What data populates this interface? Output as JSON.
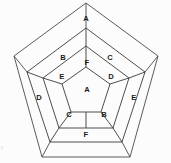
{
  "diagram": {
    "kind": "dodecahedron-net",
    "background_color": "#fcfcfc",
    "line_color": "#3a3a3a",
    "label_color": "#1c1c1c",
    "outer_pentagon": {
      "name": "outer-pentagon",
      "points": "86,3 158,56 130,157 42,157 14,56"
    },
    "middle_pentagon": {
      "name": "middle-pentagon",
      "points": "86,28 145,72 122,142 50,142 27,72"
    },
    "inner_pentagon": {
      "name": "inner-pentagon",
      "points": "86,46 129,78 113,128 59,128 43,78"
    },
    "center_pentagon": {
      "name": "center-pentagon",
      "points": "86,67 110,84 101,112 71,112 62,84"
    },
    "spokes_inner": [
      "86,46 86,67",
      "129,78 110,84",
      "113,128 101,112",
      "59,128 71,112",
      "43,78 62,84"
    ],
    "spokes_center_out": [
      "86,112 86,128"
    ],
    "spokes_middle": [
      "86,28 86,46",
      "145,72 129,78",
      "122,142 113,128",
      "50,142 59,128",
      "27,72 43,78"
    ],
    "spokes_outer": [
      "158,56 145,72",
      "130,157 122,142",
      "42,157 50,142",
      "14,56 27,72",
      "86,3 86,28"
    ],
    "labels": [
      {
        "id": "label-apex-a",
        "text": "A",
        "x": 86,
        "y": 19,
        "region": "outer-top"
      },
      {
        "id": "label-ring-b-top",
        "text": "B",
        "x": 63,
        "y": 58,
        "region": "middle-upper-left"
      },
      {
        "id": "label-ring-c-top",
        "text": "C",
        "x": 110,
        "y": 58,
        "region": "middle-upper-right"
      },
      {
        "id": "label-inner-f-top",
        "text": "F",
        "x": 87,
        "y": 63,
        "region": "inner-top"
      },
      {
        "id": "label-inner-e-left",
        "text": "E",
        "x": 62,
        "y": 77,
        "region": "inner-upper-left"
      },
      {
        "id": "label-inner-d-right",
        "text": "D",
        "x": 111,
        "y": 77,
        "region": "inner-upper-right"
      },
      {
        "id": "label-center-a",
        "text": "A",
        "x": 87,
        "y": 90,
        "region": "center"
      },
      {
        "id": "label-ring-d-left",
        "text": "D",
        "x": 39,
        "y": 98,
        "region": "middle-left"
      },
      {
        "id": "label-ring-e-right",
        "text": "E",
        "x": 134,
        "y": 98,
        "region": "middle-right"
      },
      {
        "id": "label-inner-c-low",
        "text": "C",
        "x": 69,
        "y": 115,
        "region": "inner-lower-left"
      },
      {
        "id": "label-inner-b-low",
        "text": "B",
        "x": 104,
        "y": 115,
        "region": "inner-lower-right"
      },
      {
        "id": "label-ring-f-bot",
        "text": "F",
        "x": 86,
        "y": 135,
        "region": "middle-bottom"
      }
    ],
    "edge_artifact": {
      "name": "left-edge-artifact",
      "text": "c",
      "x": 1,
      "y": 148
    }
  }
}
